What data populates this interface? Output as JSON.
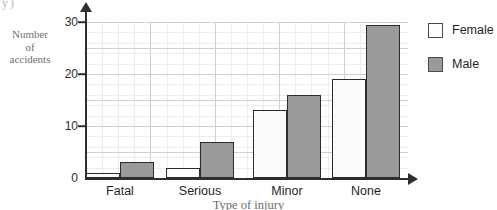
{
  "chart_data": {
    "type": "bar",
    "title": "",
    "xlabel": "Type of injury",
    "ylabel": "Number of accidents",
    "ylabel_lines": [
      "Number",
      "of",
      "accidents"
    ],
    "categories": [
      "Fatal",
      "Serious",
      "Minor",
      "None"
    ],
    "series": [
      {
        "name": "Female",
        "values": [
          1,
          2,
          13,
          19
        ],
        "color": "#fbfbfb"
      },
      {
        "name": "Male",
        "values": [
          3,
          7,
          16,
          29.5
        ],
        "color": "#9a9a9a"
      }
    ],
    "ylim": [
      0,
      30
    ],
    "yticks": [
      0,
      10,
      20,
      30
    ],
    "ytick_labels": [
      "0",
      "10",
      "20",
      "30"
    ],
    "grid": true,
    "grid_major_step": 5,
    "legend_position": "right"
  },
  "legend": {
    "items": [
      {
        "label": "Female",
        "swatch": "white-square"
      },
      {
        "label": "Male",
        "swatch": "gray-square"
      }
    ]
  },
  "artifact": {
    "text": "y)"
  }
}
